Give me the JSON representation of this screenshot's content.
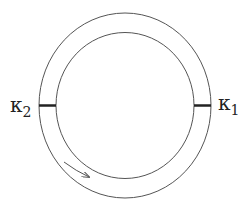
{
  "diagram": {
    "type": "ring-resonator",
    "outer_ring": {
      "cx": 125,
      "cy": 105.5,
      "rx": 86,
      "ry": 92.5
    },
    "inner_ring": {
      "cx": 125,
      "cy": 105.5,
      "rx": 69,
      "ry": 73
    },
    "couplers": [
      {
        "id": "k1",
        "label": "κ",
        "subscript": "1",
        "side": "right"
      },
      {
        "id": "k2",
        "label": "κ",
        "subscript": "2",
        "side": "left"
      }
    ],
    "arrow": {
      "direction": "clockwise",
      "meaning": "propagation direction"
    },
    "colors": {
      "line": "#555555",
      "coupler": "#222222",
      "background": "#ffffff"
    }
  }
}
